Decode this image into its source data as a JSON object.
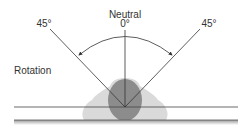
{
  "diagram": {
    "title": "Rotation",
    "labels": {
      "neutral": "Neutral",
      "zero": "0°",
      "left_angle": "45°",
      "right_angle": "45°",
      "motion": "Rotation"
    },
    "colors": {
      "line": "#333333",
      "blob_light": "#d4d4d4",
      "blob_dark": "#8a8a8a",
      "ground_shadow": "#bdbdbd"
    }
  }
}
